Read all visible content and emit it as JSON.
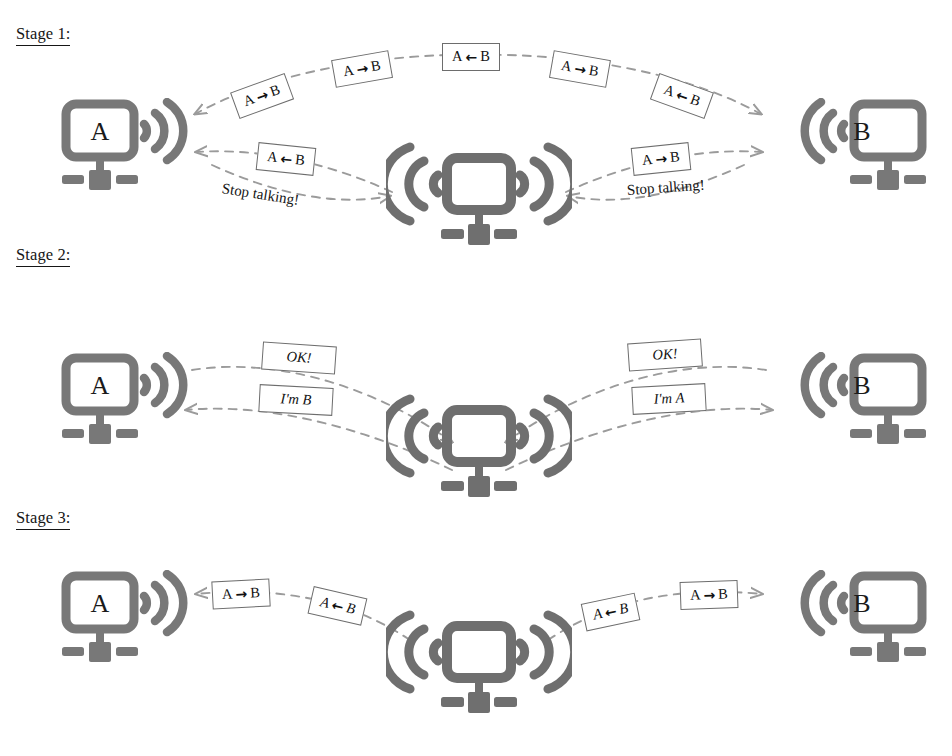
{
  "page": {
    "colors": {
      "device_gray": "#787878",
      "device_gray_dark": "#6f6f6f",
      "arrow_gray": "#9b9b9b",
      "box_border": "#6d6d6d",
      "text": "#161616",
      "background": "#ffffff"
    }
  },
  "stages": [
    {
      "id": "stage-1",
      "label": "Stage 1:"
    },
    {
      "id": "stage-2",
      "label": "Stage 2:"
    },
    {
      "id": "stage-3",
      "label": "Stage 3:"
    }
  ],
  "devices": {
    "a_label": "A",
    "b_label": "B",
    "router_label": ""
  },
  "arrows": {
    "to_b": "→",
    "to_a": "←"
  },
  "stage1": {
    "heading": "Stage 1:",
    "upper_arc_messages": [
      {
        "a": "A",
        "arrow": "→",
        "b": "B"
      },
      {
        "a": "A",
        "arrow": "→",
        "b": "B"
      },
      {
        "a": "A",
        "arrow": "←",
        "b": "B"
      },
      {
        "a": "A",
        "arrow": "→",
        "b": "B"
      },
      {
        "a": "A",
        "arrow": "←",
        "b": "B"
      }
    ],
    "lower_left_message": {
      "a": "A",
      "arrow": "←",
      "b": "B"
    },
    "lower_right_message": {
      "a": "A",
      "arrow": "→",
      "b": "B"
    },
    "lower_left_note": "Stop talking!",
    "lower_right_note": "Stop talking!"
  },
  "stage2": {
    "heading": "Stage 2:",
    "left_upper_message": "OK!",
    "left_lower_message": "I'm B",
    "right_upper_message": "OK!",
    "right_lower_message": "I'm A"
  },
  "stage3": {
    "heading": "Stage 3:",
    "left_inner_message": {
      "a": "A",
      "arrow": "→",
      "b": "B"
    },
    "left_outer_message": {
      "a": "A",
      "arrow": "←",
      "b": "B"
    },
    "right_outer_message": {
      "a": "A",
      "arrow": "←",
      "b": "B"
    },
    "right_inner_message": {
      "a": "A",
      "arrow": "→",
      "b": "B"
    }
  }
}
